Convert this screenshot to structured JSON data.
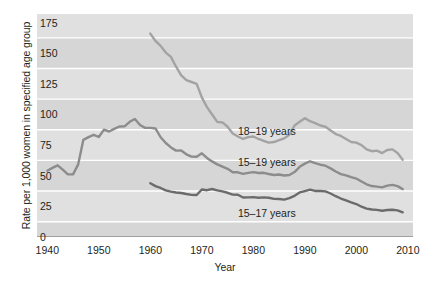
{
  "chart_data": {
    "type": "line",
    "title": "",
    "xlabel": "Year",
    "ylabel": "Rate per 1,000 women in specified age group",
    "xlim": [
      1938,
      2011
    ],
    "ylim": [
      0,
      182
    ],
    "yticks": [
      0,
      25,
      50,
      75,
      100,
      125,
      150,
      175
    ],
    "xticks": [
      1940,
      1950,
      1960,
      1970,
      1980,
      1990,
      2000,
      2010
    ],
    "grid": "horizontal-white-on-gray-bands",
    "legend_position": "inline-right-of-each-line",
    "series": [
      {
        "name": "18–19 years",
        "color": "#a3a3a3",
        "label_x": 1977,
        "label_y": 86,
        "x": [
          1960,
          1961,
          1962,
          1963,
          1964,
          1965,
          1966,
          1967,
          1968,
          1969,
          1970,
          1971,
          1972,
          1973,
          1974,
          1975,
          1976,
          1977,
          1978,
          1979,
          1980,
          1981,
          1982,
          1983,
          1984,
          1985,
          1986,
          1987,
          1988,
          1989,
          1990,
          1991,
          1992,
          1993,
          1994,
          1995,
          1996,
          1997,
          1998,
          1999,
          2000,
          2001,
          2002,
          2003,
          2004,
          2005,
          2006,
          2007,
          2008,
          2009
        ],
        "values": [
          166.0,
          160.0,
          156.0,
          150.5,
          147.0,
          139.0,
          132.0,
          128.0,
          126.5,
          125.0,
          114.0,
          106.0,
          100.0,
          94.0,
          93.5,
          90.0,
          84.5,
          82.0,
          80.0,
          81.5,
          82.0,
          80.0,
          78.5,
          77.0,
          77.5,
          79.0,
          80.5,
          83.5,
          91.0,
          94.0,
          97.0,
          94.5,
          93.0,
          91.0,
          90.0,
          87.0,
          84.0,
          82.5,
          80.0,
          77.5,
          77.0,
          75.0,
          71.5,
          70.0,
          70.5,
          68.5,
          71.0,
          71.5,
          68.5,
          63.0
        ]
      },
      {
        "name": "15–19 years",
        "color": "#8c8c8c",
        "label_x": 1977,
        "label_y": 60,
        "x": [
          1940,
          1941,
          1942,
          1943,
          1944,
          1945,
          1946,
          1947,
          1948,
          1949,
          1950,
          1951,
          1952,
          1953,
          1954,
          1955,
          1956,
          1957,
          1958,
          1959,
          1960,
          1961,
          1962,
          1963,
          1964,
          1965,
          1966,
          1967,
          1968,
          1969,
          1970,
          1971,
          1972,
          1973,
          1974,
          1975,
          1976,
          1977,
          1978,
          1979,
          1980,
          1981,
          1982,
          1983,
          1984,
          1985,
          1986,
          1987,
          1988,
          1989,
          1990,
          1991,
          1992,
          1993,
          1994,
          1995,
          1996,
          1997,
          1998,
          1999,
          2000,
          2001,
          2002,
          2003,
          2004,
          2005,
          2006,
          2007,
          2008,
          2009
        ],
        "values": [
          54.1,
          56.4,
          58.5,
          55.0,
          51.2,
          51.1,
          59.3,
          79.3,
          81.5,
          83.4,
          81.6,
          87.6,
          86.1,
          88.2,
          90.2,
          90.3,
          94.0,
          96.3,
          91.4,
          89.1,
          89.1,
          88.6,
          81.4,
          76.7,
          73.1,
          70.5,
          70.6,
          67.5,
          65.6,
          65.5,
          68.3,
          64.5,
          61.7,
          59.3,
          57.5,
          55.6,
          52.8,
          52.8,
          51.5,
          52.3,
          53.0,
          52.2,
          52.4,
          51.4,
          50.6,
          51.0,
          50.2,
          50.6,
          53.0,
          57.3,
          59.9,
          61.8,
          60.3,
          59.0,
          58.2,
          56.0,
          53.5,
          51.3,
          50.3,
          48.8,
          47.7,
          45.3,
          43.0,
          41.6,
          41.1,
          40.5,
          41.9,
          42.5,
          41.5,
          39.1
        ]
      },
      {
        "name": "15–17 years",
        "color": "#6b6b6b",
        "label_x": 1977,
        "label_y": 19,
        "x": [
          1960,
          1961,
          1962,
          1963,
          1964,
          1965,
          1966,
          1967,
          1968,
          1969,
          1970,
          1971,
          1972,
          1973,
          1974,
          1975,
          1976,
          1977,
          1978,
          1979,
          1980,
          1981,
          1982,
          1983,
          1984,
          1985,
          1986,
          1987,
          1988,
          1989,
          1990,
          1991,
          1992,
          1993,
          1994,
          1995,
          1996,
          1997,
          1998,
          1999,
          2000,
          2001,
          2002,
          2003,
          2004,
          2005,
          2006,
          2007,
          2008,
          2009
        ],
        "values": [
          43.9,
          41.5,
          40.0,
          38.0,
          37.0,
          36.3,
          35.9,
          35.1,
          34.4,
          34.3,
          38.8,
          38.2,
          39.2,
          38.1,
          37.2,
          36.1,
          34.6,
          34.5,
          32.2,
          32.3,
          32.5,
          32.0,
          32.3,
          32.0,
          31.1,
          31.0,
          30.5,
          31.7,
          33.6,
          36.4,
          37.5,
          38.6,
          37.6,
          37.5,
          37.2,
          35.5,
          33.3,
          31.4,
          29.9,
          28.2,
          26.9,
          24.7,
          23.2,
          22.4,
          22.1,
          21.4,
          22.0,
          22.2,
          21.7,
          20.1
        ]
      }
    ]
  }
}
